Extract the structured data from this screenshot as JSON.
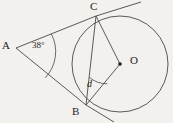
{
  "figure": {
    "type": "geometry-diagram",
    "background_color": "#f2f1ee",
    "stroke_color": "#4a4745",
    "label_color": "#1f1d1c",
    "points": {
      "A": {
        "label": "A",
        "x": 16,
        "y": 48
      },
      "B": {
        "label": "B",
        "x": 86,
        "y": 105
      },
      "C": {
        "label": "C",
        "x": 96,
        "y": 16
      },
      "O": {
        "label": "O",
        "x": 120,
        "y": 64
      }
    },
    "circle": {
      "center_x": 120,
      "center_y": 64,
      "radius": 48
    },
    "angles": {
      "at_A": {
        "label": "38°",
        "value": "38",
        "unit": "degrees",
        "arc_radius": 38
      },
      "at_B": {
        "label": "d",
        "value": "d",
        "unit": "variable",
        "arc_radius": 28
      }
    },
    "segments": [
      {
        "name": "tangent-AC",
        "from": "A",
        "to": "C"
      },
      {
        "name": "tangent-AB",
        "from": "A",
        "to": "B"
      },
      {
        "name": "chord-BC",
        "from": "B",
        "to": "C"
      },
      {
        "name": "radius-BO",
        "from": "B",
        "to": "O"
      },
      {
        "name": "radius-CO",
        "from": "C",
        "to": "O"
      }
    ],
    "tangent_extensions": [
      {
        "name": "tangent-past-C",
        "from_x": 96,
        "from_y": 16,
        "to_x": 141,
        "to_y": 2
      },
      {
        "name": "tangent-past-B",
        "from_x": 86,
        "from_y": 105,
        "to_x": 114,
        "to_y": 122
      }
    ]
  }
}
